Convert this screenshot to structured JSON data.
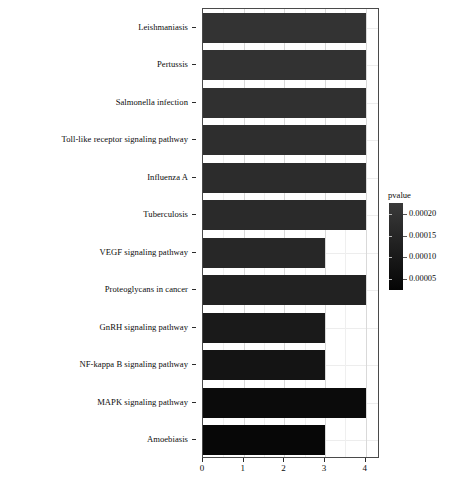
{
  "chart_data": {
    "type": "bar",
    "orientation": "horizontal",
    "title": "",
    "xlabel": "",
    "ylabel": "",
    "xlim": [
      0,
      4.35
    ],
    "xticks": [
      "0",
      "1",
      "2",
      "3",
      "4"
    ],
    "xtick_values": [
      0,
      1,
      2,
      3,
      4
    ],
    "grid": true,
    "categories": [
      "Leishmaniasis",
      "Pertussis",
      "Salmonella infection",
      "Toll-like receptor signaling pathway",
      "Influenza A",
      "Tuberculosis",
      "VEGF signaling pathway",
      "Proteoglycans in cancer",
      "GnRH signaling pathway",
      "NF-kappa B signaling pathway",
      "MAPK signaling pathway",
      "Amoebiasis"
    ],
    "values": [
      4,
      4,
      4,
      4,
      4,
      4,
      3,
      4,
      3,
      3,
      4,
      3
    ],
    "bar_colors": [
      "#333333",
      "#323232",
      "#303030",
      "#2e2e2e",
      "#2c2c2c",
      "#2a2a2a",
      "#272727",
      "#222222",
      "#1a1a1a",
      "#141414",
      "#0b0b0b",
      "#070707"
    ],
    "pvalues": [
      0.00021,
      0.0002,
      0.00019,
      0.00018,
      0.00017,
      0.00016,
      0.00014,
      0.00012,
      9e-05,
      7e-05,
      4e-05,
      2e-05
    ],
    "legend": {
      "title": "pvalue",
      "position": "right",
      "ticks": [
        "0.00020",
        "0.00015",
        "0.00010",
        "0.00005"
      ],
      "tick_values": [
        0.0002,
        0.00015,
        0.0001,
        5e-05
      ],
      "gradient_top_color": "#3a3a3a",
      "gradient_bottom_color": "#050505"
    }
  },
  "axis": {
    "panel_border_color": "#4a4a4a",
    "grid_major_color": "#d9d9d9",
    "grid_minor_color": "#efefef"
  }
}
